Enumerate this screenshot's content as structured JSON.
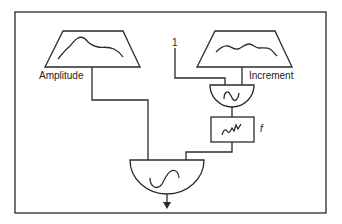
{
  "diagram": {
    "type": "synthesis-block-diagram",
    "nodes": {
      "amplitude_envelope": {
        "label": "Amplitude",
        "shape": "trapezoid-envelope"
      },
      "increment_envelope": {
        "label": "Increment",
        "shape": "trapezoid-envelope"
      },
      "constant_input": {
        "label": "1"
      },
      "modulating_oscillator": {
        "shape": "half-circle",
        "glyph": "sine-wave"
      },
      "filter": {
        "label": "f",
        "shape": "box",
        "glyph": "noise-wave"
      },
      "output_oscillator": {
        "shape": "half-circle",
        "glyph": "sine-wave"
      }
    },
    "edges": [
      {
        "from": "amplitude_envelope",
        "to": "output_oscillator"
      },
      {
        "from": "constant_input",
        "to": "modulating_oscillator"
      },
      {
        "from": "increment_envelope",
        "to": "modulating_oscillator"
      },
      {
        "from": "modulating_oscillator",
        "to": "filter"
      },
      {
        "from": "filter",
        "to": "output_oscillator"
      },
      {
        "from": "output_oscillator",
        "to": "output"
      }
    ],
    "colors": {
      "stroke": "#2a2a2a",
      "background": "#ffffff"
    }
  }
}
